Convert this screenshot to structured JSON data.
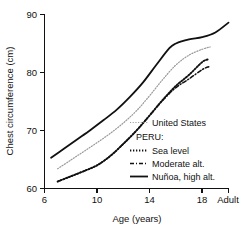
{
  "chart_data": {
    "type": "line",
    "title": "",
    "xlabel": "Age (years)",
    "ylabel": "Chest circumference (cm)",
    "xlim": [
      6,
      20
    ],
    "ylim": [
      60,
      90
    ],
    "grid": false,
    "legend_position": "inside-lower-right",
    "x_tick_labels": [
      "6",
      "10",
      "14",
      "18",
      "Adult"
    ],
    "x_tick_values": [
      6,
      10,
      14,
      18,
      20
    ],
    "y_tick_labels": [
      "60",
      "70",
      "80",
      "90"
    ],
    "y_tick_values": [
      60,
      70,
      80,
      90
    ],
    "legend_group_label": "PERU:",
    "series": [
      {
        "name": "United States",
        "style": "fine-dotted",
        "color": "#9a9a9a",
        "x": [
          7.0,
          8.0,
          9.0,
          10.0,
          11.0,
          12.0,
          13.0,
          14.0,
          15.0,
          16.0,
          17.0,
          18.0,
          18.6
        ],
        "values": [
          63.4,
          64.9,
          66.4,
          67.9,
          69.5,
          71.3,
          73.4,
          76.0,
          78.8,
          81.3,
          83.0,
          84.0,
          84.4
        ]
      },
      {
        "name": "Sea level",
        "style": "dotted",
        "color": "#111111",
        "x": [
          7.0,
          8.0,
          9.0,
          10.0,
          11.0,
          12.0,
          13.0,
          14.0,
          15.0,
          16.0,
          17.0,
          18.0,
          18.5
        ],
        "values": [
          61.2,
          62.1,
          63.0,
          64.0,
          65.6,
          67.7,
          70.0,
          72.6,
          75.3,
          77.7,
          79.6,
          81.8,
          82.3
        ]
      },
      {
        "name": "Moderate alt.",
        "style": "dash-dot",
        "color": "#111111",
        "x": [
          7.0,
          8.0,
          9.0,
          10.0,
          11.0,
          12.0,
          13.0,
          14.0,
          15.0,
          16.0,
          17.0,
          18.0,
          18.5
        ],
        "values": [
          61.2,
          62.1,
          63.0,
          64.0,
          65.6,
          67.7,
          70.0,
          72.6,
          75.2,
          77.4,
          78.9,
          80.5,
          81.0
        ]
      },
      {
        "name": "Nuñoa, high alt.",
        "style": "solid",
        "color": "#111111",
        "x": [
          6.5,
          7.5,
          8.5,
          9.5,
          10.5,
          11.5,
          12.5,
          13.5,
          14.5,
          15.5,
          16.0,
          17.0,
          18.0,
          19.0,
          20.0
        ],
        "values": [
          65.3,
          66.9,
          68.5,
          70.1,
          71.8,
          73.6,
          75.8,
          78.3,
          81.3,
          84.2,
          85.0,
          85.7,
          86.1,
          86.9,
          88.6
        ]
      }
    ]
  },
  "legend": {
    "entries": [
      {
        "label": "United States"
      },
      {
        "label": "Sea level"
      },
      {
        "label": "Moderate alt."
      },
      {
        "label": "Nuñoa, high alt."
      }
    ],
    "group_heading": "PERU:"
  },
  "axes": {
    "y_title": "Chest circumference (cm)",
    "x_title": "Age (years)"
  }
}
